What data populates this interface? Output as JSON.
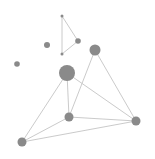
{
  "diagram": {
    "type": "network-graph",
    "node_color": "#8a8a8a",
    "edge_color": "#c4c4c4",
    "nodes": [
      {
        "id": "a",
        "cx": 62,
        "cy": 16,
        "r": 1.5
      },
      {
        "id": "b",
        "cx": 78,
        "cy": 41,
        "r": 2.8
      },
      {
        "id": "c",
        "cx": 62,
        "cy": 54,
        "r": 1.5
      },
      {
        "id": "d",
        "cx": 47,
        "cy": 45,
        "r": 3
      },
      {
        "id": "e",
        "cx": 17,
        "cy": 64,
        "r": 2.8
      },
      {
        "id": "f",
        "cx": 67,
        "cy": 73,
        "r": 8
      },
      {
        "id": "g",
        "cx": 95,
        "cy": 50,
        "r": 5.5
      },
      {
        "id": "h",
        "cx": 69,
        "cy": 117,
        "r": 4.5
      },
      {
        "id": "i",
        "cx": 136,
        "cy": 121,
        "r": 4.5
      },
      {
        "id": "j",
        "cx": 22,
        "cy": 142,
        "r": 4.5
      }
    ],
    "edges": [
      [
        "a",
        "b"
      ],
      [
        "b",
        "c"
      ],
      [
        "c",
        "a"
      ],
      [
        "f",
        "j"
      ],
      [
        "f",
        "h"
      ],
      [
        "f",
        "i"
      ],
      [
        "g",
        "h"
      ],
      [
        "g",
        "i"
      ],
      [
        "h",
        "j"
      ],
      [
        "h",
        "i"
      ],
      [
        "j",
        "i"
      ]
    ]
  }
}
